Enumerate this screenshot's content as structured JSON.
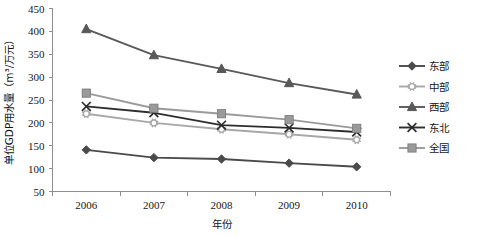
{
  "chart_data": {
    "type": "line",
    "title": "",
    "xlabel": "年份",
    "ylabel": "单位GDP用水量（m³/万元）",
    "categories": [
      "2006",
      "2007",
      "2008",
      "2009",
      "2010"
    ],
    "x": [
      2006,
      2007,
      2008,
      2009,
      2010
    ],
    "ylim": [
      50,
      450
    ],
    "yticks": [
      50,
      100,
      150,
      200,
      250,
      300,
      350,
      400,
      450
    ],
    "grid": false,
    "legend_position": "right",
    "series": [
      {
        "name": "东部",
        "marker": "diamond",
        "color": "#4a4a4a",
        "values": [
          141,
          124,
          121,
          112,
          104
        ]
      },
      {
        "name": "中部",
        "marker": "circle-star",
        "color": "#a8a8a8",
        "values": [
          220,
          200,
          186,
          175,
          163
        ]
      },
      {
        "name": "西部",
        "marker": "triangle",
        "color": "#595959",
        "values": [
          405,
          348,
          318,
          287,
          262
        ]
      },
      {
        "name": "东北",
        "marker": "x-cross",
        "color": "#2d2d2d",
        "values": [
          236,
          222,
          195,
          189,
          180
        ]
      },
      {
        "name": "全国",
        "marker": "square",
        "color": "#9a9a9a",
        "values": [
          265,
          232,
          220,
          207,
          188
        ]
      }
    ]
  },
  "axis": {
    "y_tick_labels": [
      "450",
      "400",
      "350",
      "300",
      "250",
      "200",
      "150",
      "100",
      "50"
    ],
    "x_tick_labels": [
      "2006",
      "2007",
      "2008",
      "2009",
      "2010"
    ],
    "y_title": "单位GDP用水量（m³/万元）",
    "x_title": "年份"
  },
  "legend": {
    "items": [
      {
        "label": "东部"
      },
      {
        "label": "中部"
      },
      {
        "label": "西部"
      },
      {
        "label": "东北"
      },
      {
        "label": "全国"
      }
    ]
  }
}
